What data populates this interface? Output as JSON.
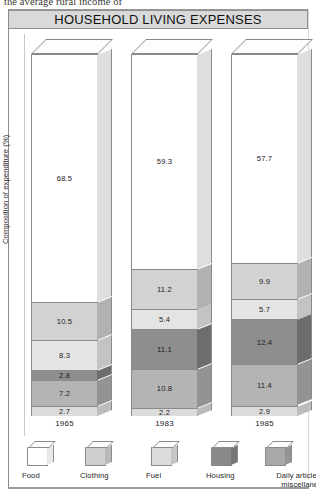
{
  "cut_text": "the average rural income of",
  "title": "HOUSEHOLD LIVING EXPENSES",
  "chart_data": {
    "type": "bar",
    "title": "HOUSEHOLD LIVING EXPENSES",
    "xlabel": "",
    "ylabel": "Composition of expenditure (%)",
    "ylim": [
      0,
      100
    ],
    "grid": false,
    "legend_position": "bottom",
    "stacked": true,
    "categories": [
      "1965",
      "1983",
      "1985"
    ],
    "series": [
      {
        "name": "Food",
        "values": [
          68.5,
          59.3,
          57.7
        ],
        "color": "#ffffff"
      },
      {
        "name": "Clothing",
        "values": [
          10.5,
          11.2,
          9.9
        ],
        "color": "#d2d2d2"
      },
      {
        "name": "Fuel",
        "values": [
          8.3,
          5.4,
          5.7
        ],
        "color": "#e4e4e4"
      },
      {
        "name": "Housing",
        "values": [
          2.8,
          11.1,
          12.4
        ],
        "color": "#8e8e8e"
      },
      {
        "name": "Daily articles and miscellaneous",
        "values": [
          7.2,
          10.8,
          11.4
        ],
        "color": "#b4b4b4"
      },
      {
        "name": "Services and recreation",
        "values": [
          2.7,
          2.2,
          2.9
        ],
        "color": "#dcdcdc"
      }
    ]
  },
  "legend": [
    {
      "label": "Food",
      "color": "#ffffff",
      "side": "#e8e8e8"
    },
    {
      "label": "Clothing",
      "color": "#cfcfcf",
      "side": "#b8b8b8"
    },
    {
      "label": "Fuel",
      "color": "#dcdcdc",
      "side": "#c6c6c6"
    },
    {
      "label": "Housing",
      "color": "#8a8a8a",
      "side": "#767676"
    },
    {
      "label": "Daily articles and miscellaneous",
      "color": "#a8a8a8",
      "side": "#949494"
    },
    {
      "label": "Services and recreation",
      "color": "#c4c4c4",
      "side": "#aeaeae"
    }
  ]
}
